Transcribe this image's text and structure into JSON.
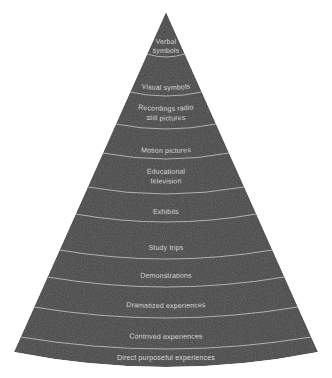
{
  "figure": {
    "name": "cone-of-experience",
    "shape": "cone",
    "background_color": "#ffffff",
    "cone_fill_color": "#4a4a4a",
    "divider_color": "#c9c9c6",
    "label_color": "#d8d8d6"
  },
  "chart_data": {
    "type": "pie",
    "title": "",
    "subtitle": "",
    "xlabel": "",
    "ylabel": "",
    "orientation": "cone-apex-up",
    "legend": "none",
    "grid": false,
    "categories": [
      "Verbal symbols",
      "Visual symbols",
      "Recordings radio still pictures",
      "Motion pictures",
      "Educational television",
      "Exhibits",
      "Study trips",
      "Demonstrations",
      "Dramatized experiences",
      "Contrived experiences",
      "Direct purposeful experiences"
    ],
    "values": [
      1,
      2,
      3,
      4,
      5,
      6,
      7,
      8,
      9,
      10,
      11
    ],
    "note": "Band widths increase monotonically from apex to base of the cone"
  },
  "bands": [
    {
      "id": "verbal-symbols",
      "lines": [
        "Verbal",
        "symbols"
      ],
      "label": "Verbal symbols",
      "text_y": 41,
      "line_gap": 9,
      "arc_y": 54,
      "arc_dip": 3,
      "size": "sm"
    },
    {
      "id": "visual-symbols",
      "lines": [
        "Visual symbols"
      ],
      "label": "Visual symbols",
      "text_y": 86,
      "line_gap": 9,
      "arc_y": 92,
      "arc_dip": 4,
      "size": "sm"
    },
    {
      "id": "recordings-radio-still-pictures",
      "lines": [
        "Recordings radio",
        "still pictures"
      ],
      "label": "Recordings radio still pictures",
      "text_y": 106,
      "line_gap": 9.5,
      "arc_y": 124,
      "arc_dip": 5,
      "size": "sm"
    },
    {
      "id": "motion-pictures",
      "lines": [
        "Motion pictures"
      ],
      "label": "Motion pictures",
      "text_y": 147,
      "line_gap": 9,
      "arc_y": 153,
      "arc_dip": 6,
      "size": "sm"
    },
    {
      "id": "educational-television",
      "lines": [
        "Educational",
        "television"
      ],
      "label": "Educational television",
      "text_y": 167,
      "line_gap": 9.5,
      "arc_y": 187,
      "arc_dip": 7,
      "size": "sm"
    },
    {
      "id": "exhibits",
      "lines": [
        "Exhibits"
      ],
      "label": "Exhibits",
      "text_y": 206,
      "line_gap": 9,
      "arc_y": 214,
      "arc_dip": 8,
      "size": "sm"
    },
    {
      "id": "study-trips",
      "lines": [
        "Study trips"
      ],
      "label": "Study trips",
      "text_y": 241,
      "line_gap": 9,
      "arc_y": 250,
      "arc_dip": 9,
      "size": "sm"
    },
    {
      "id": "demonstrations",
      "lines": [
        "Demonstrations"
      ],
      "label": "Demonstrations",
      "text_y": 268,
      "line_gap": 9,
      "arc_y": 277,
      "arc_dip": 10,
      "size": "sm"
    },
    {
      "id": "dramatized-experiences",
      "lines": [
        "Dramatized experiences"
      ],
      "label": "Dramatized experiences",
      "text_y": 297,
      "line_gap": 9,
      "arc_y": 307,
      "arc_dip": 11,
      "size": "sm"
    },
    {
      "id": "contrived-experiences",
      "lines": [
        "Contrived experiences"
      ],
      "label": "Contrived experiences",
      "text_y": 327,
      "line_gap": 9,
      "arc_y": 337,
      "arc_dip": 12,
      "size": "sm"
    },
    {
      "id": "direct-purposeful-experiences",
      "lines": [
        "Direct purposeful experiences"
      ],
      "label": "Direct purposeful experiences",
      "text_y": 360,
      "line_gap": 9,
      "arc_y": null,
      "arc_dip": 0,
      "size": "sm"
    }
  ]
}
